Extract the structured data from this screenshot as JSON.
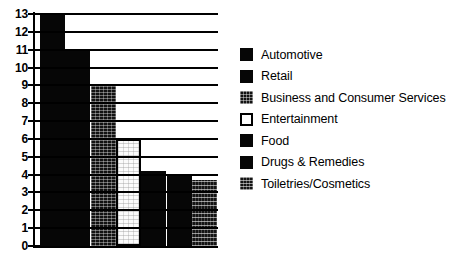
{
  "chart_data": {
    "type": "bar",
    "title": "",
    "subtitle": "",
    "xlabel": "",
    "ylabel": "",
    "ylim": [
      0,
      13
    ],
    "grid": true,
    "legend_position": "right",
    "categories": [
      "Automotive",
      "Retail",
      "Business and Consumer Services",
      "Entertainment",
      "Food",
      "Drugs & Remedies",
      "Toiletries/Cosmetics"
    ],
    "values": [
      13,
      11,
      9,
      6,
      4.2,
      4,
      3.7
    ],
    "ytick_labels": [
      "13",
      "12",
      "11",
      "10",
      "9",
      "8",
      "7",
      "6",
      "5",
      "4",
      "3",
      "2",
      "1",
      "0"
    ],
    "xtick_labels": [],
    "fills": [
      "solid-black",
      "solid-black",
      "dark-speckle",
      "white-speckle",
      "solid-black",
      "solid-black",
      "banded"
    ]
  },
  "legend": {
    "items": [
      {
        "label": "Automotive",
        "fill": "solid-black"
      },
      {
        "label": "Retail",
        "fill": "solid-black"
      },
      {
        "label": "Business and Consumer Services",
        "fill": "dark-speckle"
      },
      {
        "label": "Entertainment",
        "fill": "white-speckle"
      },
      {
        "label": "Food",
        "fill": "solid-black"
      },
      {
        "label": "Drugs & Remedies",
        "fill": "solid-black"
      },
      {
        "label": "Toiletries/Cosmetics",
        "fill": "banded"
      }
    ]
  },
  "colors": {
    "axis": "#000000",
    "grid": "#000000",
    "background": "#ffffff",
    "bar_dark": "#060606",
    "bar_light": "#fbfbfb"
  }
}
